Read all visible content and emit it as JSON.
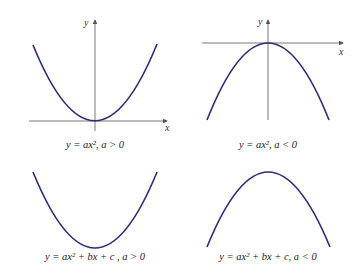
{
  "panels": [
    {
      "id": "tl",
      "axis_x": "x",
      "axis_y": "y",
      "caption": "y = ax², a > 0"
    },
    {
      "id": "tr",
      "axis_x": "x",
      "axis_y": "y",
      "caption": "y = ax², a < 0"
    },
    {
      "id": "bl",
      "caption": "y = ax² + bx + c , a > 0"
    },
    {
      "id": "br",
      "caption": "y = ax² + bx + c, a < 0"
    }
  ],
  "colors": {
    "curve": "#2e2a7a",
    "axis": "#555555",
    "text": "#222222"
  }
}
